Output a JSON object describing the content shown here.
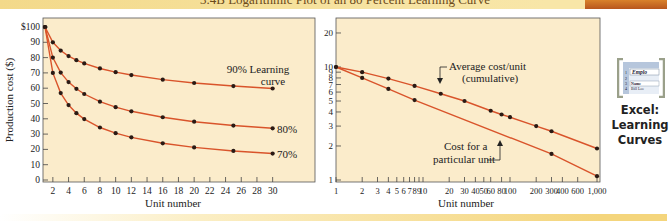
{
  "banner": {
    "title": "3.4B    Logarithmic Plot of an 80 Percent Learning Curve",
    "accent_color": "#c86a22"
  },
  "side_panel": {
    "icon": "excel-spreadsheet-icon",
    "icon_cells": [
      "1",
      "2",
      "3",
      "4",
      "Emplo",
      "Name",
      "Bill Lee"
    ],
    "label_line1": "Excel:",
    "label_line2": "Learning",
    "label_line3": "Curves"
  },
  "chart_data": [
    {
      "type": "line",
      "title": "",
      "xlabel": "Unit number",
      "ylabel": "Production cost ($)",
      "xlim": [
        1,
        30
      ],
      "ylim": [
        0,
        100
      ],
      "x_ticks": [
        "2",
        "4",
        "6",
        "8",
        "10",
        "12",
        "14",
        "16",
        "18",
        "20",
        "22",
        "24",
        "26",
        "28",
        "30"
      ],
      "y_ticks": [
        "0",
        "10",
        "20",
        "30",
        "40",
        "50",
        "60",
        "70",
        "80",
        "90",
        "$100"
      ],
      "grid": false,
      "background": "#fbeccb",
      "line_color": "#d9542b",
      "series": [
        {
          "name": "90% Learning curve",
          "x": [
            1,
            2,
            3,
            4,
            5,
            6,
            8,
            10,
            12,
            16,
            20,
            25,
            30
          ],
          "values": [
            100,
            90,
            84.6,
            81,
            78.3,
            76.2,
            72.9,
            70.5,
            68.6,
            65.6,
            63.4,
            61.4,
            59.8
          ]
        },
        {
          "name": "80%",
          "x": [
            1,
            2,
            3,
            4,
            5,
            6,
            8,
            10,
            12,
            16,
            20,
            25,
            30
          ],
          "values": [
            100,
            80,
            70.2,
            64,
            59.6,
            56.2,
            51.2,
            47.6,
            44.9,
            41,
            38.1,
            35.6,
            33.8
          ]
        },
        {
          "name": "70%",
          "x": [
            1,
            2,
            3,
            4,
            5,
            6,
            8,
            10,
            12,
            16,
            20,
            25,
            30
          ],
          "values": [
            100,
            70,
            56.8,
            49,
            43.7,
            39.8,
            34.3,
            30.6,
            27.9,
            24,
            21.3,
            19,
            17.3
          ]
        }
      ],
      "annotations": [
        "90% Learning curve",
        "80%",
        "70%"
      ]
    },
    {
      "type": "line",
      "title": "",
      "xlabel": "Unit number",
      "ylabel": "",
      "x_scale": "log",
      "y_scale": "log",
      "xlim": [
        1,
        1000
      ],
      "ylim": [
        1,
        20
      ],
      "x_ticks": [
        "1",
        "2",
        "3",
        "4",
        "5",
        "6",
        "7",
        "8",
        "9",
        "10",
        "20",
        "30",
        "40",
        "50",
        "60",
        "80",
        "100",
        "200",
        "300",
        "400",
        "600",
        "1,000"
      ],
      "y_ticks": [
        "1",
        "2",
        "3",
        "4",
        "5",
        "6",
        "7",
        "8",
        "9",
        "10",
        "20"
      ],
      "grid": false,
      "background": "#fbeccb",
      "line_color": "#d9542b",
      "series": [
        {
          "name": "Average cost/unit (cumulative)",
          "x": [
            1,
            2,
            4,
            8,
            16,
            30,
            60,
            80,
            100,
            200,
            300,
            1000
          ],
          "values": [
            10,
            9,
            7.9,
            6.8,
            5.8,
            5.0,
            4.1,
            3.8,
            3.6,
            3.0,
            2.7,
            1.9
          ]
        },
        {
          "name": "Cost for a particular unit",
          "x": [
            1,
            2,
            4,
            8,
            300,
            1000
          ],
          "values": [
            10,
            8,
            6.4,
            5.1,
            1.7,
            1.08
          ]
        }
      ],
      "annotations": [
        "Average cost/unit (cumulative)",
        "Cost for a particular unit"
      ]
    }
  ]
}
